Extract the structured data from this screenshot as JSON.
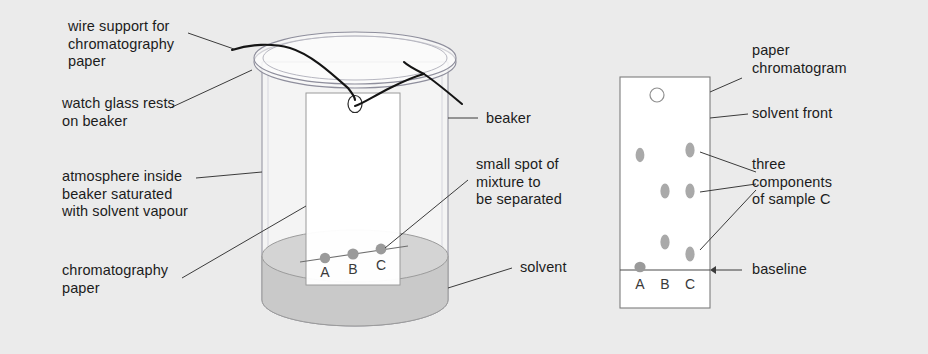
{
  "figure": {
    "background_color": "#ebebeb",
    "ink_color": "#1c1c1c"
  },
  "labels": {
    "wire_support": "wire support for\nchromatography\npaper",
    "watch_glass": "watch glass rests\non beaker",
    "atmosphere": "atmosphere inside\nbeaker saturated\nwith solvent vapour",
    "chromatography_paper": "chromatography\npaper",
    "beaker": "beaker",
    "small_spot": "small spot of\nmixture to\nbe separated",
    "solvent": "solvent",
    "paper_chromatogram": "paper\nchromatogram",
    "solvent_front": "solvent front",
    "three_components": "three\ncomponents\nof sample C",
    "baseline": "baseline"
  },
  "apparatus": {
    "lane_letters": [
      "A",
      "B",
      "C"
    ],
    "spot_color": "#9a9a9a",
    "solvent_color": "#c9c9c9",
    "glass_color": "#8c8c9a",
    "wire_color": "#1a1a1a"
  },
  "chromatogram": {
    "lane_letters": [
      "A",
      "B",
      "C"
    ],
    "spot_color": "#a9a9a9",
    "paper_fill": "#ffffff",
    "paper_border": "#7d7d7d",
    "lanes": [
      {
        "letter": "A",
        "spots": [
          {
            "rf": 0.74
          }
        ]
      },
      {
        "letter": "B",
        "spots": [
          {
            "rf": 0.47
          },
          {
            "rf": 0.14
          }
        ]
      },
      {
        "letter": "C",
        "spots": [
          {
            "rf": 0.78
          },
          {
            "rf": 0.47
          },
          {
            "rf": 0.08
          }
        ]
      }
    ],
    "baseline_label": "baseline",
    "solvent_front_marker": "open-circle"
  }
}
